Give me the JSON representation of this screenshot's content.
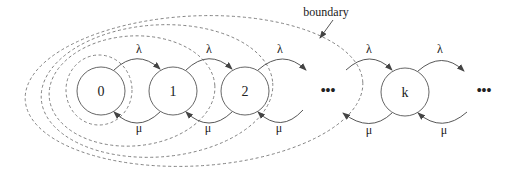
{
  "annotation": {
    "text": "boundary"
  },
  "states": [
    {
      "id": "s0",
      "label": "0",
      "cx": 101,
      "cy": 91
    },
    {
      "id": "s1",
      "label": "1",
      "cx": 173,
      "cy": 91
    },
    {
      "id": "s2",
      "label": "2",
      "cx": 245,
      "cy": 91
    },
    {
      "id": "sk",
      "label": "k",
      "cx": 405,
      "cy": 92
    }
  ],
  "ellipsis": [
    {
      "text": "•••",
      "x": 328,
      "y": 95
    },
    {
      "text": "•••",
      "x": 484,
      "y": 95
    }
  ],
  "arrival_rate": "λ",
  "service_rate": "μ",
  "transitions": [
    {
      "from": "0",
      "to": "1",
      "rate": "λ",
      "dir": "forward"
    },
    {
      "from": "1",
      "to": "2",
      "rate": "λ",
      "dir": "forward"
    },
    {
      "from": "2",
      "to": "…",
      "rate": "λ",
      "dir": "forward"
    },
    {
      "from": "…",
      "to": "k",
      "rate": "λ",
      "dir": "forward"
    },
    {
      "from": "k",
      "to": "…",
      "rate": "λ",
      "dir": "forward"
    },
    {
      "from": "1",
      "to": "0",
      "rate": "μ",
      "dir": "backward"
    },
    {
      "from": "2",
      "to": "1",
      "rate": "μ",
      "dir": "backward"
    },
    {
      "from": "…",
      "to": "2",
      "rate": "μ",
      "dir": "backward"
    },
    {
      "from": "k",
      "to": "…",
      "rate": "μ",
      "dir": "backward"
    },
    {
      "from": "…",
      "to": "k",
      "rate": "μ",
      "dir": "backward"
    }
  ],
  "boundaries": [
    {
      "encloses": [
        "0"
      ]
    },
    {
      "encloses": [
        "0",
        "1"
      ]
    },
    {
      "encloses": [
        "0",
        "1",
        "2"
      ]
    },
    {
      "encloses": [
        "0",
        "1",
        "2",
        "…"
      ]
    }
  ],
  "colors": {
    "line": "#444444",
    "dashed": "#777777",
    "text": "#222222"
  }
}
